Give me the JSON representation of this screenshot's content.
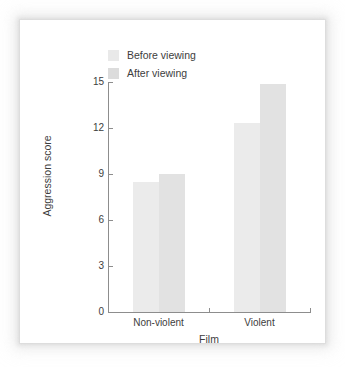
{
  "chart_data": {
    "type": "bar",
    "title": "",
    "subtitle": "",
    "xlabel": "Film",
    "ylabel": "Aggression score",
    "categories": [
      "Non-violent",
      "Violent"
    ],
    "series": [
      {
        "name": "Before viewing",
        "values": [
          8.5,
          12.3
        ],
        "color": "#ebebeb"
      },
      {
        "name": "After viewing",
        "values": [
          9.0,
          14.9
        ],
        "color": "#e2e2e2"
      }
    ],
    "ylim": [
      0,
      15
    ],
    "yticks": [
      0,
      3,
      6,
      9,
      12,
      15
    ],
    "ytick_labels": [
      "0",
      "3",
      "6",
      "9",
      "12",
      "15"
    ],
    "grid": false,
    "legend_position": "top-left-inside"
  },
  "legend": {
    "items": [
      {
        "label": "Before viewing",
        "swatch": "legend-swatch-before"
      },
      {
        "label": "After viewing",
        "swatch": "legend-swatch-after"
      }
    ]
  },
  "axes": {
    "y_title": "Aggression score",
    "x_title": "Film",
    "y_tick_labels": [
      "15",
      "12",
      "9",
      "6",
      "3",
      "0"
    ],
    "x_tick_labels": [
      "Non-violent",
      "Violent"
    ]
  }
}
